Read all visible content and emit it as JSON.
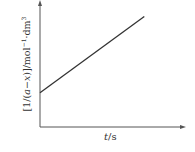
{
  "chart_data": {
    "type": "line",
    "title": "",
    "xlabel": "t/s",
    "ylabel": "[1/(a−x)]/mol⁻¹·dm³",
    "xlabel_parts": {
      "var": "t",
      "unit": "/s"
    },
    "ylabel_parts": {
      "prefix": "[1/(",
      "var_a": "a",
      "minus": "−",
      "var_x": "x",
      "mid": ")]/mol",
      "exp1": "−1",
      "dot": "·dm",
      "exp2": "3"
    },
    "grid": false,
    "legend": null,
    "axis_ticks": false,
    "series": [
      {
        "name": "1/(a−x) vs t",
        "description": "Straight line with positive slope and positive y-intercept",
        "x": [
          0,
          1
        ],
        "y": [
          0.27,
          0.87
        ]
      }
    ],
    "xlim": [
      0,
      1.4
    ],
    "ylim": [
      0,
      1
    ],
    "colors": {
      "axis": "#555555",
      "line": "#333333",
      "text": "#333333"
    }
  }
}
